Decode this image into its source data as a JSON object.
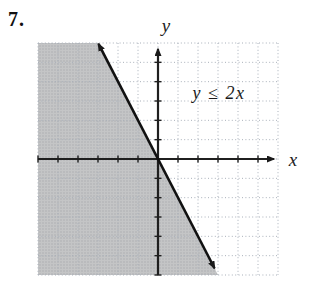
{
  "problem": {
    "number_label": "7."
  },
  "colors": {
    "background": "#ffffff",
    "shaded_region_base": "#c4c5c6",
    "shaded_region_dot": "#aaabad",
    "grid_line": "#a9b0ba",
    "axis": "#1f1f1f",
    "boundary_line": "#111111",
    "text": "#1a1a1a"
  },
  "chart_data": {
    "type": "line",
    "title": "",
    "annotation": "y ≤ 2x",
    "xlabel": "x",
    "ylabel": "y",
    "xlim": [
      -6,
      6
    ],
    "ylim": [
      -6,
      6
    ],
    "grid": true,
    "grid_style": "dotted",
    "axes_through_origin": true,
    "tick_interval": 1,
    "boundary_line": {
      "slope": -2,
      "y_intercept": 0,
      "passes_through": [
        0,
        0
      ],
      "style": "solid",
      "arrows": "both",
      "draw_span_y_units": [
        5.95,
        -5.65
      ]
    },
    "shaded_region": {
      "side": "left of boundary line",
      "description": "half-plane left/below the boundary line is shaded gray"
    },
    "inequality_label_position_units": [
      3.0,
      3.4
    ]
  }
}
